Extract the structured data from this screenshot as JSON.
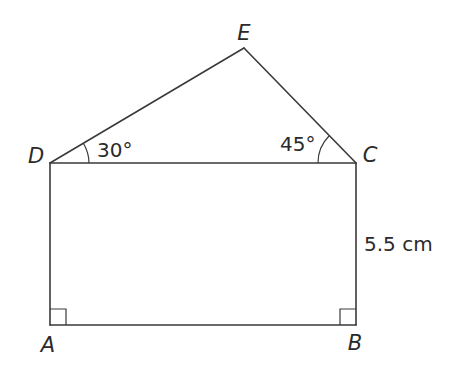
{
  "diagram": {
    "type": "geometry",
    "vertices": {
      "A": {
        "label": "A",
        "x": 50,
        "y": 325
      },
      "B": {
        "label": "B",
        "x": 356,
        "y": 325
      },
      "C": {
        "label": "C",
        "x": 356,
        "y": 163
      },
      "D": {
        "label": "D",
        "x": 50,
        "y": 163
      },
      "E": {
        "label": "E",
        "x": 244,
        "y": 48
      }
    },
    "angles": {
      "EDC": {
        "label": "30°"
      },
      "ECD": {
        "label": "45°"
      },
      "A": {
        "label": "right angle"
      },
      "B": {
        "label": "right angle"
      }
    },
    "measurements": {
      "BC": {
        "label": "5.5 cm"
      }
    }
  }
}
